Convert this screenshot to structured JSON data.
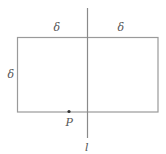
{
  "diagram": {
    "type": "geometry-figure",
    "width": 166,
    "height": 154,
    "colors": {
      "background": "#ffffff",
      "stroke": "#9a9a9a",
      "text": "#555555",
      "point": "#333333"
    },
    "rectangle": {
      "x": 17,
      "y": 37,
      "width": 141,
      "height": 75
    },
    "line": {
      "label": "l",
      "x": 87.5,
      "y1": 8,
      "y2": 138
    },
    "point": {
      "label": "P",
      "x": 69,
      "y": 111
    },
    "labels": {
      "delta_top_left": "δ",
      "delta_top_right": "δ",
      "delta_left": "δ",
      "point_label": "P",
      "line_label": "l"
    }
  }
}
